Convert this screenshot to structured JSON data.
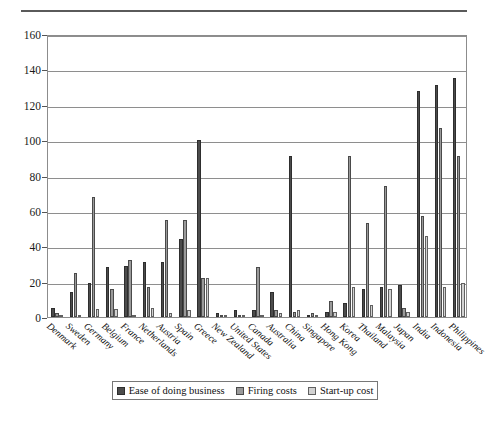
{
  "chart_data": {
    "type": "bar",
    "title": "",
    "subtitle": "",
    "xlabel": "",
    "ylabel": "",
    "ylim": [
      0,
      160
    ],
    "ytick_step": 20,
    "yticks": [
      0,
      20,
      40,
      60,
      80,
      100,
      120,
      140,
      160
    ],
    "grid": true,
    "legend_position": "bottom",
    "categories": [
      "Denmark",
      "Sweden",
      "Germany",
      "Belgium",
      "France",
      "Netherlands",
      "Austria",
      "Spain",
      "Greece",
      "New Zealand",
      "United States",
      "Canada",
      "Australia",
      "China",
      "Singapore",
      "Hong Kong",
      "Korea",
      "Thailand",
      "Malaysia",
      "Japan",
      "India",
      "Indonesia",
      "Philippines"
    ],
    "series": [
      {
        "name": "Ease of doing business",
        "color": "#4c4c4c",
        "values": [
          5,
          14,
          19,
          28,
          29,
          31,
          31,
          44,
          100,
          2,
          4,
          4,
          14,
          91,
          1,
          3,
          8,
          16,
          17,
          18,
          128,
          131,
          135
        ]
      },
      {
        "name": "Firing costs",
        "color": "#9a9a9a",
        "values": [
          2,
          25,
          68,
          16,
          32,
          17,
          55,
          55,
          22,
          0,
          1,
          28,
          4,
          3,
          2,
          9,
          91,
          53,
          74,
          5,
          57,
          107,
          91
        ]
      },
      {
        "name": "Start-up cost",
        "color": "#d2d2d2",
        "values": [
          0.5,
          0.5,
          4.5,
          4.5,
          0.5,
          5,
          2,
          4,
          22,
          0.3,
          0.5,
          0.5,
          2,
          4,
          0.5,
          3,
          17,
          7,
          16,
          3,
          46,
          17,
          19
        ]
      }
    ],
    "legend": [
      {
        "label": "Ease of doing business",
        "swatch": "s0"
      },
      {
        "label": "Firing costs",
        "swatch": "s1"
      },
      {
        "label": "Start-up cost",
        "swatch": "s2"
      }
    ]
  }
}
